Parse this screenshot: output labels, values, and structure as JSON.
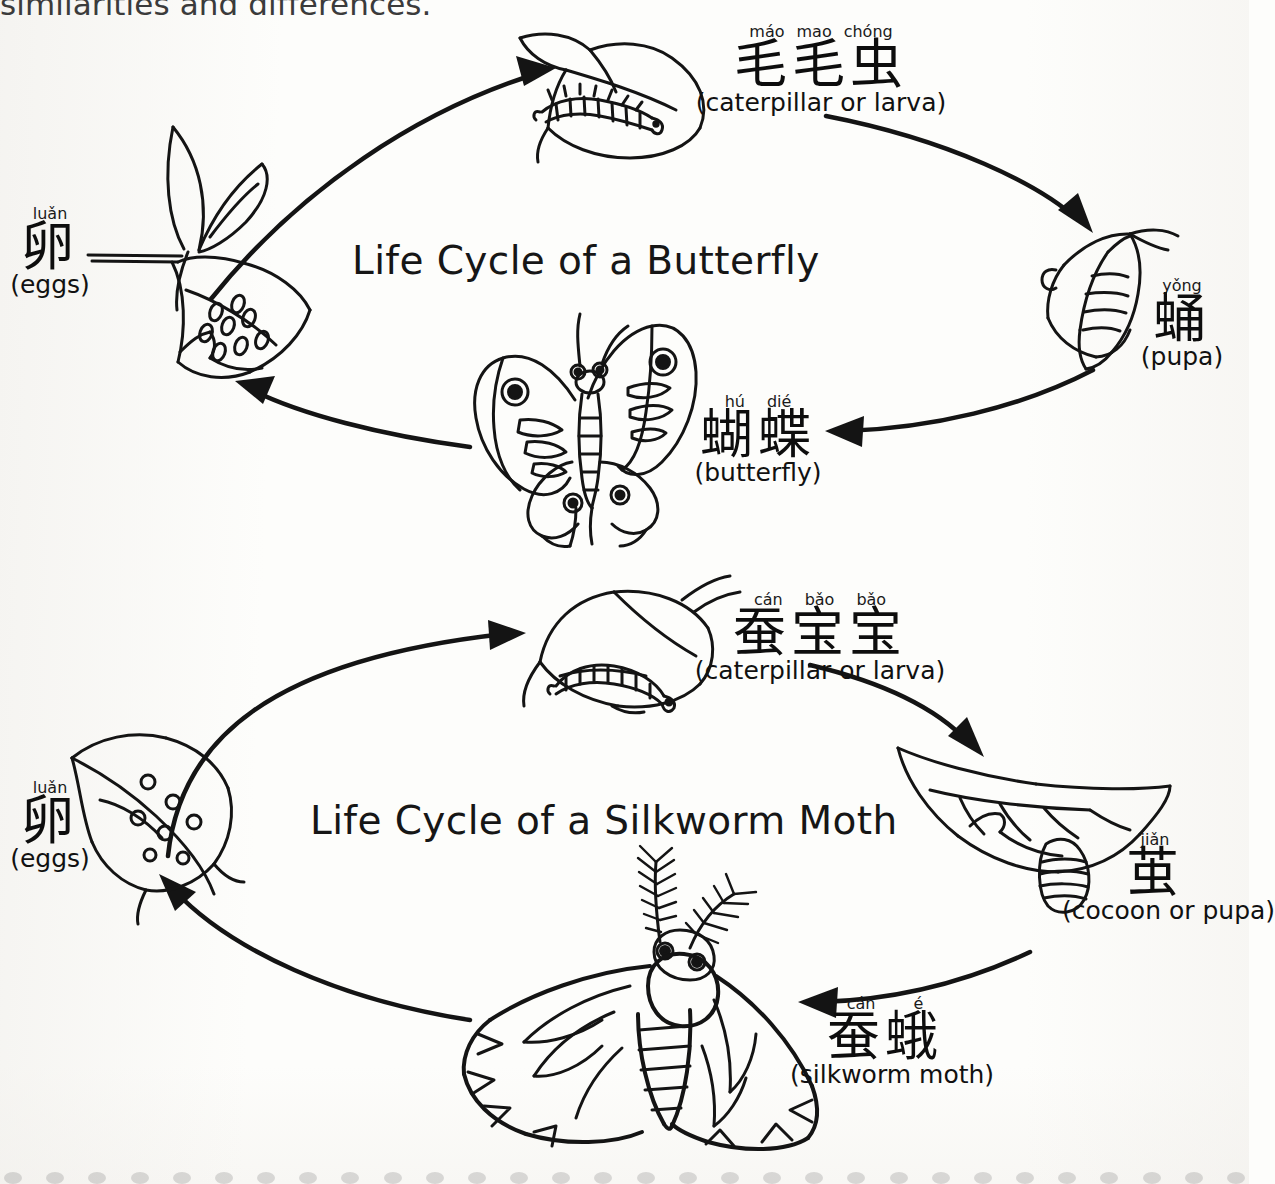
{
  "page": {
    "cut_off_heading": "similarities and differences."
  },
  "butterfly_cycle": {
    "title": "Life Cycle of a Butterfly",
    "stages": [
      {
        "id": "eggs",
        "pinyin": [
          "luǎn"
        ],
        "hanzi": "卵",
        "english": "(eggs)",
        "illustration": "leaf-with-eggs"
      },
      {
        "id": "caterpillar",
        "pinyin": [
          "máo",
          "mao",
          "chóng"
        ],
        "hanzi": "毛毛虫",
        "english": "(caterpillar or larva)",
        "illustration": "caterpillar-on-leaf"
      },
      {
        "id": "pupa",
        "pinyin": [
          "yǒng"
        ],
        "hanzi": "蛹",
        "english": "(pupa)",
        "illustration": "chrysalis-on-branch"
      },
      {
        "id": "butterfly",
        "pinyin": [
          "hú",
          "dié"
        ],
        "hanzi": "蝴蝶",
        "english": "(butterfly)",
        "illustration": "butterfly"
      }
    ]
  },
  "silkworm_cycle": {
    "title": "Life Cycle of a Silkworm Moth",
    "stages": [
      {
        "id": "eggs",
        "pinyin": [
          "luǎn"
        ],
        "hanzi": "卵",
        "english": "(eggs)",
        "illustration": "leaf-with-eggs"
      },
      {
        "id": "larva",
        "pinyin": [
          "cán",
          "bǎo",
          "bǎo"
        ],
        "hanzi": "蚕宝宝",
        "english": "(caterpillar or larva)",
        "illustration": "silkworm-on-mulberry-leaf"
      },
      {
        "id": "cocoon",
        "pinyin": [
          "jiǎn"
        ],
        "hanzi": "茧",
        "english": "(cocoon or pupa)",
        "illustration": "cocoon-on-leaf"
      },
      {
        "id": "moth",
        "pinyin": [
          "cán",
          "é"
        ],
        "hanzi": "蚕蛾",
        "english": "(silkworm moth)",
        "illustration": "silkworm-moth"
      }
    ]
  },
  "colors": {
    "ink": "#111111",
    "paper": "#fdfdfb",
    "cut_text": "#3b3b3b"
  }
}
